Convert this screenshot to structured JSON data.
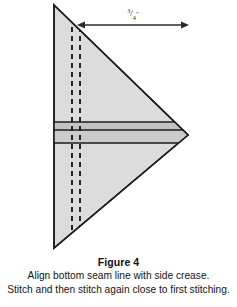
{
  "figure": {
    "label": "Figure 4",
    "caption_lines": [
      "Align bottom seam line with side crease.",
      "Stitch and then stitch again close to first stitching."
    ]
  },
  "diagram": {
    "dimension": {
      "label": "3/4\"",
      "numerator": "3",
      "slash": "/",
      "denominator": "4",
      "unit": "\"",
      "measures": "distance from fold crease to right point"
    },
    "shape": {
      "name": "right-pointing-triangle",
      "fill": "#dcdcdc",
      "stroke": "#1c1c1c",
      "apex_x": 188,
      "apex_y": 135,
      "top_x": 54,
      "top_y": 5,
      "bottom_x": 54,
      "bottom_y": 248
    },
    "seam_band": {
      "fill": "#c2c2c2",
      "stroke": "#1c1c1c",
      "line_y_values": [
        122,
        130,
        143
      ]
    },
    "crease_lines": {
      "style": "dashed",
      "color": "#1c1c1c",
      "x_values": [
        72,
        80
      ]
    },
    "arrow": {
      "color": "#2a2a2a",
      "y": 25,
      "x_start": 78,
      "x_end": 188
    }
  },
  "colors": {
    "paper": "#ffffff",
    "ink": "#1a1a1a",
    "fabric_light": "#dcdcdc",
    "fabric_band": "#c2c2c2",
    "line": "#1c1c1c"
  }
}
